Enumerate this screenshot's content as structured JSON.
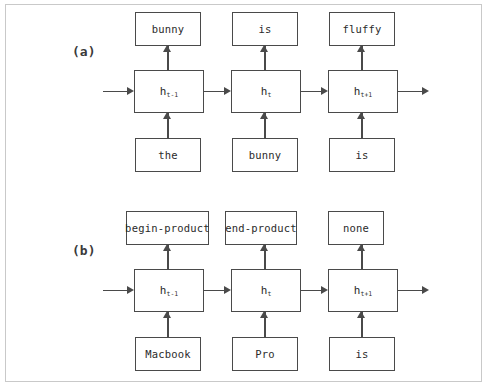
{
  "figure": {
    "caption_label_a": "(a)",
    "caption_label_b": "(b)",
    "border_color": "#c9c9c9",
    "stroke_color": "#4a4a4a",
    "background_color": "#ffffff",
    "text_color": "#2b2b2b"
  },
  "panels": [
    {
      "id": "a",
      "label": "(a)",
      "task": "language-model",
      "outputs": [
        {
          "label": "bunny"
        },
        {
          "label": "is"
        },
        {
          "label": "fluffy"
        }
      ],
      "hidden_states": [
        {
          "base": "h",
          "sub": "t-1"
        },
        {
          "base": "h",
          "sub": "t"
        },
        {
          "base": "h",
          "sub": "t+1"
        }
      ],
      "inputs": [
        {
          "label": "the"
        },
        {
          "label": "bunny"
        },
        {
          "label": "is"
        }
      ]
    },
    {
      "id": "b",
      "label": "(b)",
      "task": "sequence-tagging",
      "outputs": [
        {
          "label": "begin-product"
        },
        {
          "label": "end-product"
        },
        {
          "label": "none"
        }
      ],
      "hidden_states": [
        {
          "base": "h",
          "sub": "t-1"
        },
        {
          "base": "h",
          "sub": "t"
        },
        {
          "base": "h",
          "sub": "t+1"
        }
      ],
      "inputs": [
        {
          "label": "Macbook"
        },
        {
          "label": "Pro"
        },
        {
          "label": "is"
        }
      ]
    }
  ]
}
